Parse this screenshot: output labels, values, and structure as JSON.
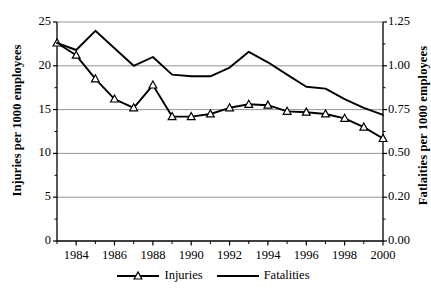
{
  "chart_data": {
    "type": "line",
    "title": "",
    "xlabel": "",
    "ylabel": "Injuries per 1000 employees",
    "y2label": "Fatlaities per 1000 employees",
    "x": [
      1983,
      1984,
      1985,
      1986,
      1987,
      1988,
      1989,
      1990,
      1991,
      1992,
      1993,
      1994,
      1995,
      1996,
      1997,
      1998,
      1999,
      2000
    ],
    "xlim": [
      1983,
      2000
    ],
    "xticks": [
      1984,
      1986,
      1988,
      1990,
      1992,
      1994,
      1996,
      1998,
      2000
    ],
    "xticklabels": [
      "1984",
      "1986",
      "1988",
      "1990",
      "1992",
      "1994",
      "1996",
      "1998",
      "2000"
    ],
    "xminorticks": [
      1983,
      1985,
      1987,
      1989,
      1991,
      1993,
      1995,
      1997,
      1999
    ],
    "ylim": [
      0,
      25
    ],
    "yticks": [
      0,
      5,
      10,
      15,
      20,
      25
    ],
    "yticklabels": [
      "0",
      "5",
      "10",
      "15",
      "20",
      "25"
    ],
    "y2lim": [
      0,
      1.25
    ],
    "y2ticks": [
      0,
      0.25,
      0.5,
      0.75,
      1.0,
      1.25
    ],
    "y2ticklabels": [
      "0.00",
      "0.20",
      "0.50",
      "0.75",
      "1.00",
      "1.25"
    ],
    "grid": true,
    "grid_axis": "y",
    "legend_position": "bottom",
    "series": [
      {
        "name": "Injuries",
        "axis": "left",
        "marker": "triangle-open",
        "color": "#000000",
        "values": [
          22.6,
          21.2,
          18.5,
          16.2,
          15.2,
          17.8,
          14.2,
          14.2,
          14.5,
          15.2,
          15.6,
          15.5,
          14.8,
          14.7,
          14.5,
          14.0,
          13.0,
          11.7
        ]
      },
      {
        "name": "Fatalities",
        "axis": "right",
        "marker": "none",
        "color": "#000000",
        "values": [
          1.13,
          1.09,
          1.2,
          1.1,
          1.0,
          1.05,
          0.95,
          0.94,
          0.94,
          0.99,
          1.08,
          1.02,
          0.95,
          0.88,
          0.87,
          0.81,
          0.76,
          0.72
        ]
      }
    ]
  },
  "legend": {
    "items": [
      {
        "label": "Injuries",
        "marker": "triangle-open"
      },
      {
        "label": "Fatalities",
        "marker": "line"
      }
    ]
  }
}
